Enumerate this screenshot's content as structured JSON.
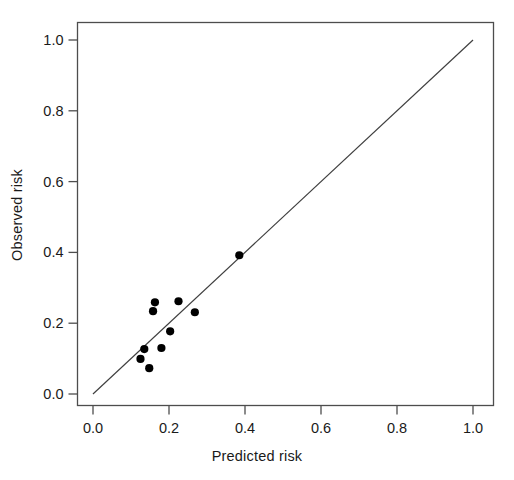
{
  "chart_data": {
    "type": "scatter",
    "title": "",
    "xlabel": "Predicted risk",
    "ylabel": "Observed risk",
    "xlim": [
      0.0,
      1.0
    ],
    "ylim": [
      0.0,
      1.0
    ],
    "xticks": [
      0.0,
      0.2,
      0.4,
      0.6,
      0.8,
      1.0
    ],
    "yticks": [
      0.0,
      0.2,
      0.4,
      0.6,
      0.8,
      1.0
    ],
    "xtick_labels": [
      "0.0",
      "0.2",
      "0.4",
      "0.6",
      "0.8",
      "1.0"
    ],
    "ytick_labels": [
      "0.0",
      "0.2",
      "0.4",
      "0.6",
      "0.8",
      "1.0"
    ],
    "grid": false,
    "legend": null,
    "frame": true,
    "point_color": "#000000",
    "line_color": "#3f3f3f",
    "reference_line": {
      "name": "identity-line",
      "x": [
        0.0,
        1.0
      ],
      "y": [
        0.0,
        1.0
      ]
    },
    "series": [
      {
        "name": "calibration-points",
        "marker": "filled-circle",
        "points": [
          {
            "x": 0.125,
            "y": 0.099
          },
          {
            "x": 0.135,
            "y": 0.127
          },
          {
            "x": 0.148,
            "y": 0.073
          },
          {
            "x": 0.158,
            "y": 0.234
          },
          {
            "x": 0.163,
            "y": 0.259
          },
          {
            "x": 0.18,
            "y": 0.13
          },
          {
            "x": 0.203,
            "y": 0.177
          },
          {
            "x": 0.225,
            "y": 0.262
          },
          {
            "x": 0.268,
            "y": 0.231
          },
          {
            "x": 0.385,
            "y": 0.392
          }
        ]
      }
    ]
  }
}
